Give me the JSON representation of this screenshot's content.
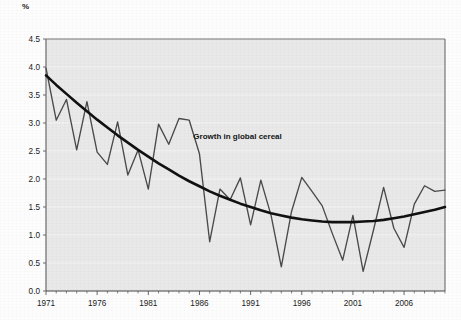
{
  "unit_label": "%",
  "colors": {
    "series_line": "#4a4a4a",
    "trend_line": "#111111",
    "plot_background": "#e9e9e9",
    "gridline": "#f4f4f4",
    "axis": "#6a6a6a",
    "text": "#1b1b1b"
  },
  "annotation": {
    "text": "Growth in global cereal",
    "x": 1985.4,
    "y": 2.72
  },
  "chart_data": {
    "type": "line",
    "title": "",
    "subtitle": "",
    "xlabel": "",
    "ylabel": "%",
    "xlim": [
      1971,
      2010
    ],
    "ylim": [
      0.0,
      4.5
    ],
    "grid": true,
    "legend_position": "none",
    "ytick_labels": [
      "0.0",
      "0.5",
      "1.0",
      "1.5",
      "2.0",
      "2.5",
      "3.0",
      "3.5",
      "4.0",
      "4.5"
    ],
    "ytick_values": [
      0.0,
      0.5,
      1.0,
      1.5,
      2.0,
      2.5,
      3.0,
      3.5,
      4.0,
      4.5
    ],
    "xtick_labels": [
      "1971",
      "1976",
      "1981",
      "1986",
      "1991",
      "1996",
      "2001",
      "2006"
    ],
    "xtick_values": [
      1971,
      1976,
      1981,
      1986,
      1991,
      1996,
      2001,
      2006
    ],
    "xtick_minor_values": [
      1972,
      1973,
      1974,
      1975,
      1977,
      1978,
      1979,
      1980,
      1982,
      1983,
      1984,
      1985,
      1987,
      1988,
      1989,
      1990,
      1992,
      1993,
      1994,
      1995,
      1997,
      1998,
      1999,
      2000,
      2002,
      2003,
      2004,
      2005,
      2007,
      2008,
      2009,
      2010
    ],
    "x": [
      1971,
      1972,
      1973,
      1974,
      1975,
      1976,
      1977,
      1978,
      1979,
      1980,
      1981,
      1982,
      1983,
      1984,
      1985,
      1986,
      1987,
      1988,
      1989,
      1990,
      1991,
      1992,
      1993,
      1994,
      1995,
      1996,
      1997,
      1998,
      1999,
      2000,
      2001,
      2002,
      2003,
      2004,
      2005,
      2006,
      2007,
      2008,
      2009,
      2010
    ],
    "series": [
      {
        "name": "Growth in global cereal",
        "type": "line",
        "values": [
          3.98,
          3.05,
          3.42,
          2.52,
          3.38,
          2.48,
          2.26,
          3.02,
          2.07,
          2.52,
          1.82,
          2.98,
          2.62,
          3.08,
          3.05,
          2.45,
          0.88,
          1.82,
          1.63,
          2.02,
          1.18,
          1.98,
          1.35,
          0.43,
          1.42,
          2.03,
          1.78,
          1.52,
          1.02,
          0.55,
          1.35,
          0.35,
          1.08,
          1.85,
          1.12,
          0.78,
          1.55,
          1.88,
          1.78,
          1.8
        ]
      },
      {
        "name": "Trend (polynomial fit)",
        "type": "trend",
        "values": [
          3.85,
          3.68,
          3.52,
          3.36,
          3.21,
          3.06,
          2.92,
          2.78,
          2.65,
          2.52,
          2.4,
          2.28,
          2.17,
          2.06,
          1.96,
          1.87,
          1.78,
          1.7,
          1.63,
          1.56,
          1.5,
          1.44,
          1.39,
          1.35,
          1.31,
          1.28,
          1.26,
          1.24,
          1.23,
          1.23,
          1.23,
          1.24,
          1.25,
          1.27,
          1.3,
          1.33,
          1.37,
          1.41,
          1.45,
          1.5
        ]
      }
    ]
  }
}
